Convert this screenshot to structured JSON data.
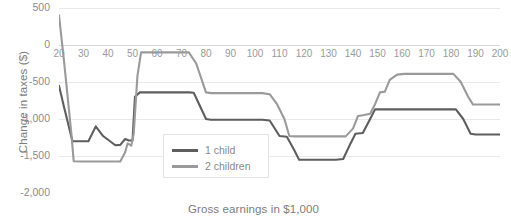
{
  "chart_data": {
    "type": "line",
    "title": "",
    "xlabel": "Gross earnings in $1,000",
    "ylabel": "Change in taxes ($)",
    "xlim": [
      20,
      200
    ],
    "ylim": [
      -2000,
      500
    ],
    "yticks": [
      "500",
      "0",
      "-500",
      "-1,000",
      "-1,500",
      "-2,000"
    ],
    "ytick_values": [
      500,
      0,
      -500,
      -1000,
      -1500,
      -2000
    ],
    "xticks": [
      "20",
      "30",
      "40",
      "50",
      "60",
      "70",
      "80",
      "90",
      "100",
      "110",
      "120",
      "130",
      "140",
      "150",
      "160",
      "170",
      "180",
      "190",
      "200"
    ],
    "xtick_values": [
      20,
      30,
      40,
      50,
      60,
      70,
      80,
      90,
      100,
      110,
      120,
      130,
      140,
      150,
      160,
      170,
      180,
      190,
      200
    ],
    "grid": true,
    "legend_position": "center",
    "series": [
      {
        "name": "1 child",
        "color": "#5e5e5e",
        "points": [
          [
            20,
            -550
          ],
          [
            22,
            -830
          ],
          [
            25.5,
            -1300
          ],
          [
            27,
            -1300
          ],
          [
            32,
            -1300
          ],
          [
            35,
            -1100
          ],
          [
            38,
            -1230
          ],
          [
            43,
            -1355
          ],
          [
            45,
            -1350
          ],
          [
            47,
            -1270
          ],
          [
            48.5,
            -1290
          ],
          [
            50,
            -1290
          ],
          [
            51,
            -700
          ],
          [
            53,
            -640
          ],
          [
            73,
            -640
          ],
          [
            75,
            -645
          ],
          [
            80,
            -1000
          ],
          [
            82,
            -1010
          ],
          [
            103,
            -1010
          ],
          [
            106,
            -1020
          ],
          [
            110,
            -1230
          ],
          [
            113,
            -1240
          ],
          [
            116,
            -1420
          ],
          [
            118,
            -1550
          ],
          [
            133,
            -1550
          ],
          [
            136,
            -1540
          ],
          [
            139,
            -1330
          ],
          [
            141,
            -1200
          ],
          [
            144,
            -1190
          ],
          [
            147,
            -1000
          ],
          [
            149,
            -870
          ],
          [
            152,
            -870
          ],
          [
            182,
            -870
          ],
          [
            185,
            -1000
          ],
          [
            188,
            -1200
          ],
          [
            190,
            -1210
          ],
          [
            200,
            -1210
          ]
        ]
      },
      {
        "name": "2 children",
        "color": "#9a9a9a",
        "points": [
          [
            20,
            400
          ],
          [
            22,
            -200
          ],
          [
            25,
            -1180
          ],
          [
            26,
            -1570
          ],
          [
            29,
            -1575
          ],
          [
            45,
            -1575
          ],
          [
            47,
            -1450
          ],
          [
            48,
            -1330
          ],
          [
            49.5,
            -1360
          ],
          [
            50.5,
            -1200
          ],
          [
            52,
            -420
          ],
          [
            53.5,
            -100
          ],
          [
            73,
            -100
          ],
          [
            76,
            -250
          ],
          [
            80,
            -640
          ],
          [
            82,
            -650
          ],
          [
            103,
            -650
          ],
          [
            106,
            -665
          ],
          [
            109,
            -800
          ],
          [
            112,
            -1000
          ],
          [
            114,
            -1230
          ],
          [
            116,
            -1235
          ],
          [
            137,
            -1235
          ],
          [
            140,
            -1130
          ],
          [
            142,
            -960
          ],
          [
            144,
            -950
          ],
          [
            147,
            -930
          ],
          [
            149,
            -800
          ],
          [
            151,
            -640
          ],
          [
            153,
            -630
          ],
          [
            155,
            -470
          ],
          [
            158,
            -400
          ],
          [
            161,
            -390
          ],
          [
            181,
            -390
          ],
          [
            184,
            -500
          ],
          [
            187,
            -700
          ],
          [
            189,
            -805
          ],
          [
            200,
            -805
          ]
        ]
      }
    ]
  },
  "legend": {
    "items": [
      {
        "label": "1 child",
        "color": "#5e5e5e"
      },
      {
        "label": "2 children",
        "color": "#9a9a9a"
      }
    ]
  },
  "axes": {
    "y_title": "Change in taxes ($)",
    "x_title": "Gross earnings in $1,000"
  },
  "colors": {
    "grid": "#e9e9e9",
    "axis_text": "#8c8c8c",
    "series_1": "#5e5e5e",
    "series_2": "#9a9a9a",
    "background": "#ffffff"
  }
}
